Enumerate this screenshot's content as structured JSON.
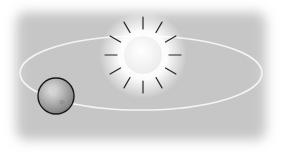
{
  "diagram": {
    "background": {
      "color": "#c4c4c4",
      "edge_color": "#ffffff"
    },
    "orbit": {
      "cx": 141,
      "cy": 73,
      "rx": 121,
      "ry": 37,
      "color": "#f4f4f4",
      "width": 1.6
    },
    "sun": {
      "label": "Sun",
      "cx": 143,
      "cy": 55,
      "r": 19,
      "fill": "#f8f8f8",
      "glow": "#ffffff",
      "ray_color": "#222222",
      "ray_count": 12,
      "ray_inner": 26,
      "ray_outer": 38
    },
    "earth": {
      "label": "Earth",
      "cx": 56,
      "cy": 96,
      "r": 18,
      "fill": "#9a9a9a",
      "highlight": "#dddddd",
      "outline": "#1a1a1a"
    }
  }
}
